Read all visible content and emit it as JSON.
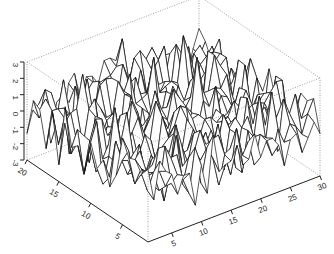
{
  "chart_data": {
    "type": "surface",
    "title": "",
    "xlabel": "",
    "ylabel": "",
    "zlabel": "",
    "x_ticks": [
      "5",
      "10",
      "15",
      "20",
      "25",
      "30"
    ],
    "y_ticks": [
      "5",
      "10",
      "15",
      "20"
    ],
    "z_ticks": [
      "-3",
      "-2",
      "-1",
      "0",
      "1",
      "2",
      "3"
    ],
    "xlim": [
      1,
      30
    ],
    "ylim": [
      1,
      20
    ],
    "zlim": [
      -3,
      3
    ],
    "grid_size": {
      "nx": 30,
      "ny": 20
    },
    "surface_description": "Random noise surface (approx. standard normal values) on a 30 x 20 grid, drawn as a white wireframe perspective plot with dotted bounding box",
    "seed": 7,
    "colors": {
      "facet_fill": "#ffffff",
      "facet_edge": "#111111",
      "box": "#888888",
      "axis": "#222222"
    }
  }
}
